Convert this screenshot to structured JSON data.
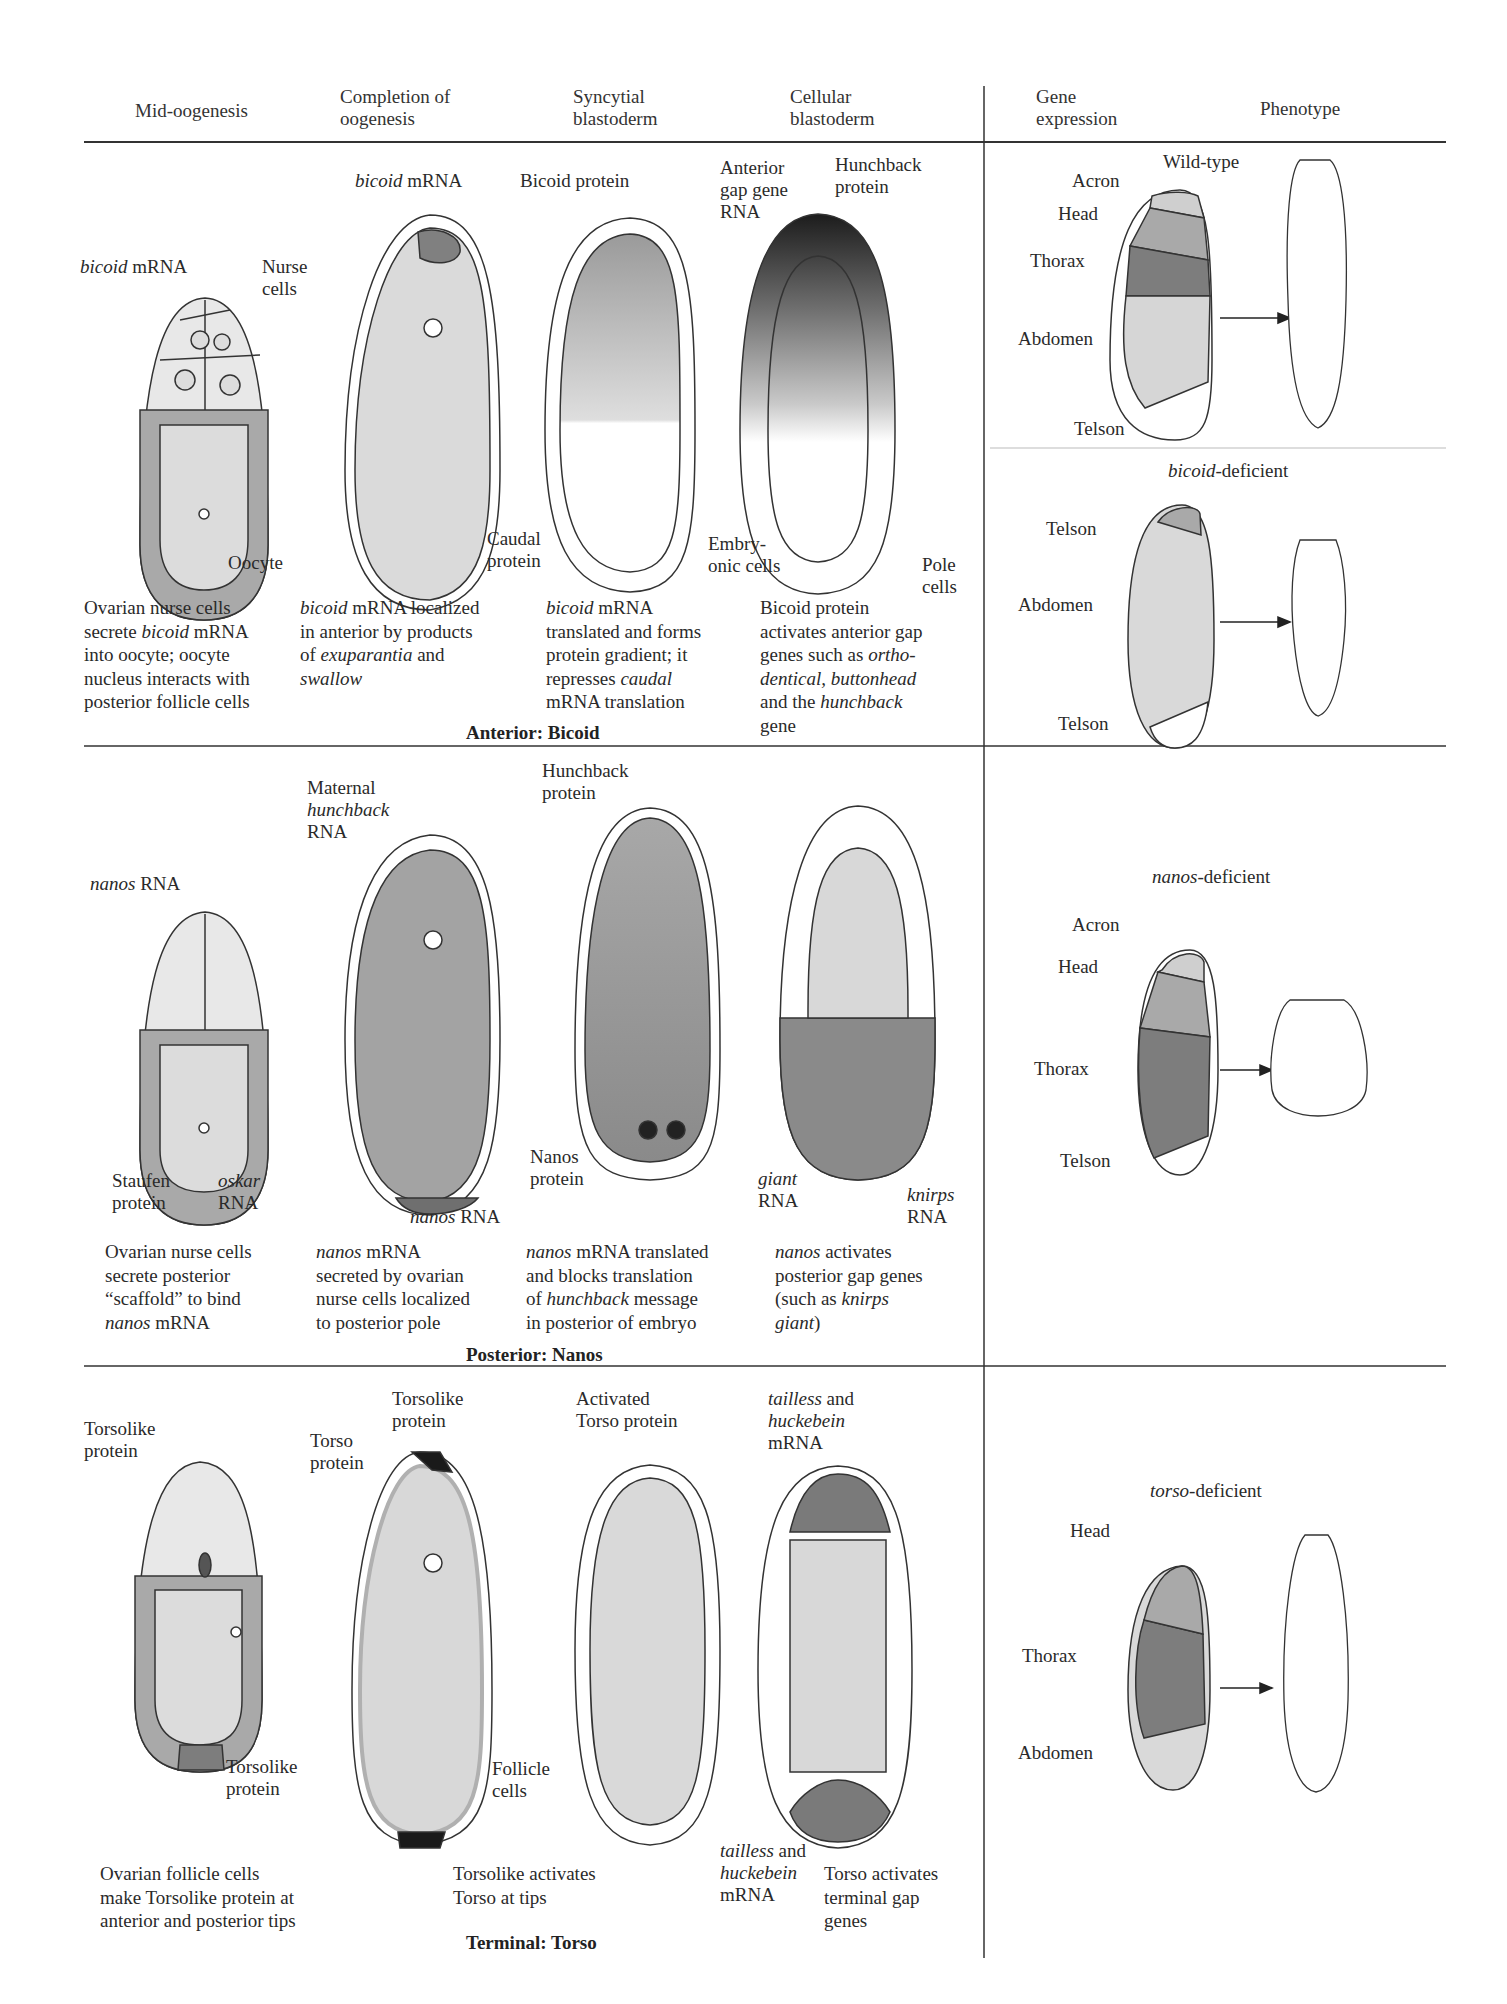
{
  "headers": {
    "col1": "Mid-oogenesis",
    "col2_l1": "Completion of",
    "col2_l2": "oogenesis",
    "col3_l1": "Syncytial",
    "col3_l2": "blastoderm",
    "col4_l1": "Cellular",
    "col4_l2": "blastoderm",
    "col5_l1": "Gene",
    "col5_l2": "expression",
    "col6": "Phenotype"
  },
  "colors": {
    "light_gray": "#d9d9d9",
    "mid_gray": "#a9a9a9",
    "dark_gray": "#7a7a7a",
    "black_tip": "#1a1a1a",
    "line": "#333333"
  },
  "anterior": {
    "section_label": "Anterior: Bicoid",
    "mid_oogenesis": {
      "labels": {
        "bicoid_ital": "bicoid",
        "bicoid_rest": " mRNA",
        "nurse_l1": "Nurse",
        "nurse_l2": "cells",
        "oocyte": "Oocyte"
      },
      "caption": [
        "Ovarian nurse cells",
        "secrete |bicoid| mRNA",
        "into oocyte; oocyte",
        "nucleus interacts with",
        "posterior follicle cells"
      ]
    },
    "completion": {
      "labels": {
        "bicoid_ital": "bicoid",
        "bicoid_rest": " mRNA"
      },
      "caption": [
        "|bicoid| mRNA  localized",
        "in anterior by products",
        "of |exuparantia| and",
        "|swallow|"
      ]
    },
    "syncytial": {
      "labels": {
        "bicoid_protein": "Bicoid protein",
        "caudal_l1": "Caudal",
        "caudal_l2": "protein"
      },
      "caption": [
        "|bicoid| mRNA",
        "translated and forms",
        "protein gradient; it",
        "represses |caudal|",
        "mRNA translation"
      ]
    },
    "cellular": {
      "labels": {
        "anterior_l1": "Anterior",
        "anterior_l2": "gap gene",
        "anterior_l3": "RNA",
        "hunchback_l1": "Hunchback",
        "hunchback_l2": "protein",
        "embryo_l1": "Embry-",
        "embryo_l2": "onic cells",
        "pole_l1": "Pole",
        "pole_l2": "cells"
      },
      "caption": [
        "Bicoid protein",
        "activates anterior gap",
        "genes such as |ortho-|",
        "|dentical, buttonhead|",
        "and the |hunchback|",
        "gene"
      ]
    },
    "gene_expression": {
      "title": "Wild-type",
      "regions": [
        "Acron",
        "Head",
        "Thorax",
        "Abdomen",
        "Telson"
      ]
    },
    "deficient": {
      "title_ital": "bicoid",
      "title_rest": "-deficient",
      "regions": [
        "Telson",
        "Abdomen",
        "Telson"
      ]
    }
  },
  "posterior": {
    "section_label": "Posterior: Nanos",
    "mid_oogenesis": {
      "labels": {
        "nanos_ital": "nanos",
        "nanos_rest": " RNA",
        "staufen_l1": "Staufen",
        "staufen_l2": "protein",
        "oskar_ital": "oskar",
        "oskar_l2": "RNA"
      },
      "caption": [
        "Ovarian nurse cells",
        "secrete posterior",
        "“scaffold” to bind",
        "|nanos| mRNA"
      ]
    },
    "completion": {
      "labels": {
        "maternal_l1": "Maternal",
        "maternal_l2": "hunchback",
        "maternal_l3": "RNA",
        "nanos_ital": "nanos",
        "nanos_rest": " RNA"
      },
      "caption": [
        "|nanos| mRNA",
        "secreted by ovarian",
        "nurse cells localized",
        "to posterior pole"
      ]
    },
    "syncytial": {
      "labels": {
        "hunchback_l1": "Hunchback",
        "hunchback_l2": "protein",
        "nanos_l1": "Nanos",
        "nanos_l2": "protein"
      },
      "caption": [
        "|nanos| mRNA translated",
        "and blocks translation",
        "of |hunchback| message",
        "in posterior of embryo"
      ]
    },
    "cellular": {
      "labels": {
        "giant_ital": "giant",
        "giant_l2": "RNA",
        "knirps_ital": "knirps",
        "knirps_l2": "RNA"
      },
      "caption": [
        "|nanos| activates",
        "posterior gap genes",
        "(such as |knirps|",
        "|giant|)"
      ]
    },
    "deficient": {
      "title_ital": "nanos",
      "title_rest": "-deficient",
      "regions": [
        "Acron",
        "Head",
        "Thorax",
        "Telson"
      ]
    }
  },
  "terminal": {
    "section_label": "Terminal: Torso",
    "mid_oogenesis": {
      "labels": {
        "torsolike_top_l1": "Torsolike",
        "torsolike_top_l2": "protein",
        "torsolike_bot_l1": "Torsolike",
        "torsolike_bot_l2": "protein"
      },
      "caption": [
        "Ovarian follicle cells",
        "make Torsolike protein at",
        "anterior and posterior tips"
      ]
    },
    "completion": {
      "labels": {
        "torso_l1": "Torso",
        "torso_l2": "protein",
        "torsolike_l1": "Torsolike",
        "torsolike_l2": "protein",
        "follicle_l1": "Follicle",
        "follicle_l2": "cells"
      },
      "caption": [
        "Torsolike activates",
        "Torso at tips"
      ]
    },
    "syncytial": {
      "labels": {
        "activated_l1": "Activated",
        "activated_l2": "Torso protein"
      }
    },
    "cellular": {
      "labels": {
        "tailless_top_ital": "tailless",
        "tailless_top_rest": " and",
        "huckebein_top": "huckebein",
        "mrna_top": "mRNA",
        "tailless_bot_ital": "tailless",
        "tailless_bot_rest": " and",
        "huckebein_bot": "huckebein",
        "mrna_bot": "mRNA"
      },
      "caption": [
        "Torso activates",
        "terminal gap",
        "genes"
      ]
    },
    "deficient": {
      "title_ital": "torso",
      "title_rest": "-deficient",
      "regions": [
        "Head",
        "Thorax",
        "Abdomen"
      ]
    }
  }
}
